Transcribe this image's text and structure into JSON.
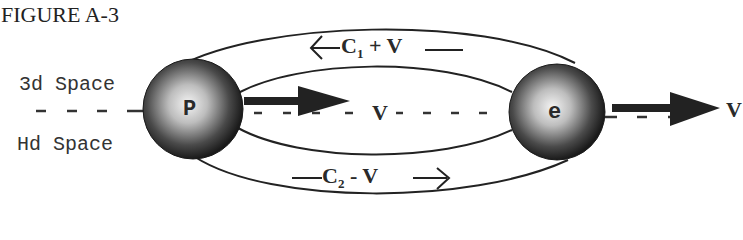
{
  "figure": {
    "title": "FIGURE A-3"
  },
  "labels": {
    "space_3d": "3d Space",
    "space_hd": "Hd Space",
    "left_dashes": "- - - -"
  },
  "particles": {
    "proton": {
      "label": "P"
    },
    "electron": {
      "label": "e"
    }
  },
  "flows": {
    "upper": {
      "text": "C",
      "subscript": "1",
      "rest": " + V",
      "direction": "left"
    },
    "lower": {
      "text": "C",
      "subscript": "2",
      "rest": " - V",
      "direction": "right"
    },
    "middle": {
      "text": "V"
    }
  },
  "velocity": {
    "label": "V"
  },
  "colors": {
    "ink": "#222222",
    "sphere_dark": "#1e1e1e",
    "sphere_light": "#f2f2f2",
    "background": "#ffffff"
  }
}
